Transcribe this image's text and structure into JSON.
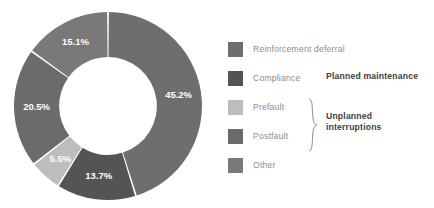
{
  "chart_data": {
    "type": "pie",
    "variant": "donut",
    "title": "",
    "xlabel": "",
    "ylabel": "",
    "unit": "%",
    "total": 100.0,
    "start_angle_deg": 0,
    "direction": "clockwise",
    "inner_radius_ratio": 0.52,
    "legend_position": "right",
    "grid": false,
    "categories": [
      "Reinforcement deferral",
      "Compliance",
      "Prefault",
      "Postfault",
      "Other"
    ],
    "values": [
      45.2,
      13.7,
      5.5,
      20.5,
      15.1
    ],
    "data_labels": [
      "45.2%",
      "13.7%",
      "5.5%",
      "20.5%",
      "15.1%"
    ],
    "colors": [
      "#6e6e6e",
      "#545454",
      "#bdbdbd",
      "#6b6b6b",
      "#797979"
    ],
    "groups": [
      {
        "label": "Planned maintenance",
        "members": [
          "Reinforcement deferral",
          "Compliance"
        ]
      },
      {
        "label": "Unplanned interruptions",
        "members": [
          "Prefault",
          "Postfault"
        ]
      }
    ]
  },
  "legend": {
    "items": [
      {
        "label": "Reinforcement deferral",
        "color": "#6e6e6e"
      },
      {
        "label": "Compliance",
        "color": "#545454"
      },
      {
        "label": "Prefault",
        "color": "#bdbdbd"
      },
      {
        "label": "Postfault",
        "color": "#6b6b6b"
      },
      {
        "label": "Other",
        "color": "#797979"
      }
    ],
    "group_planned": "Planned maintenance",
    "group_unplanned_line1": "Unplanned",
    "group_unplanned_line2": "interruptions"
  },
  "slice_labels": {
    "s0": "45.2%",
    "s1": "13.7%",
    "s2": "5.5%",
    "s3": "20.5%",
    "s4": "15.1%"
  }
}
